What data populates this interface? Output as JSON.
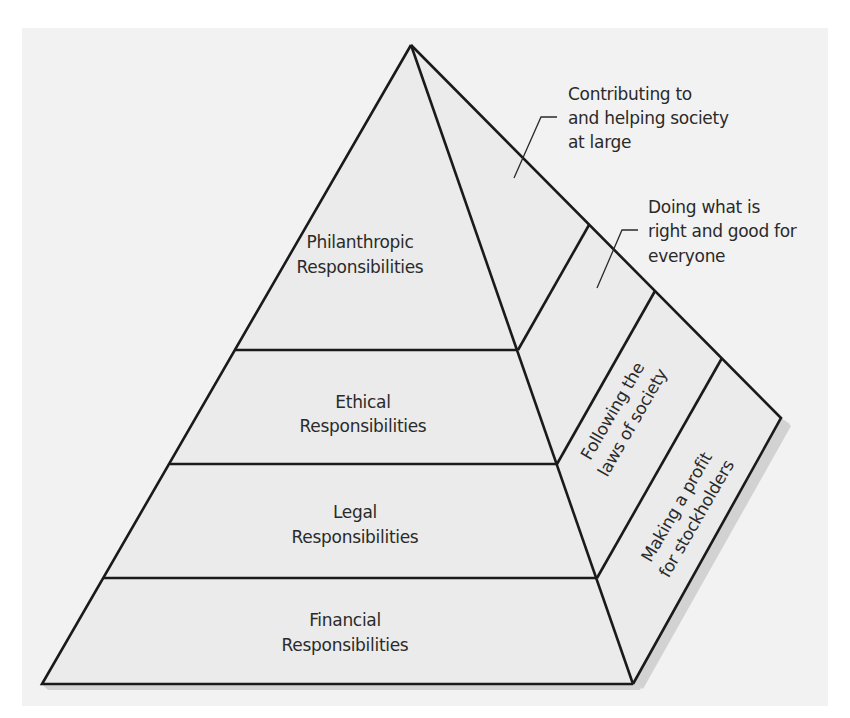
{
  "diagram": {
    "type": "pyramid",
    "colors": {
      "page_bg": "#ffffff",
      "panel_bg": "#f2f2f2",
      "front_face": "#ebebeb",
      "side_face": "#ebebeb",
      "shadow": "#cfcfcf",
      "line": "#1a1a1a",
      "text": "#2a2a2a"
    },
    "levels": [
      {
        "name": "philanthropic",
        "label_line1": "Philanthropic",
        "label_line2": "Responsibilities",
        "side_description": "Contributing to and helping society at large",
        "callout_lines": [
          "Contributing to",
          "and helping society",
          "at large"
        ]
      },
      {
        "name": "ethical",
        "label_line1": "Ethical",
        "label_line2": "Responsibilities",
        "side_description": "Doing what is right and good for everyone",
        "callout_lines": [
          "Doing what is",
          "right and good for",
          "everyone"
        ]
      },
      {
        "name": "legal",
        "label_line1": "Legal",
        "label_line2": "Responsibilities",
        "side_lines": [
          "Following the",
          "laws of society"
        ]
      },
      {
        "name": "financial",
        "label_line1": "Financial",
        "label_line2": "Responsibilities",
        "side_lines": [
          "Making a profit",
          "for stockholders"
        ]
      }
    ]
  }
}
